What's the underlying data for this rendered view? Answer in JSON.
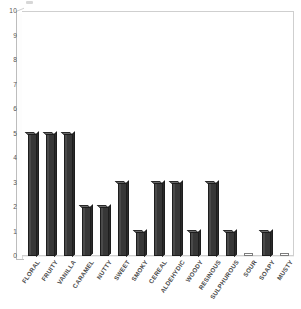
{
  "chart_data": {
    "type": "bar",
    "title": "",
    "subtitle": "",
    "xlabel": "",
    "ylabel": "",
    "ylim": [
      0,
      10
    ],
    "yticks": [
      0,
      1,
      2,
      3,
      4,
      5,
      6,
      7,
      8,
      9,
      10
    ],
    "grid": false,
    "legend": null,
    "orientation": "vertical",
    "bar_color": "#3b3b3b",
    "plot_border_color": "#cfcfcf",
    "categories": [
      "FLORAL",
      "FRUITY",
      "VANILLA",
      "CARAMEL",
      "NUTTY",
      "SWEET",
      "SMOKY",
      "CEREAL",
      "ALDEHYDIC",
      "WOODY",
      "RESINOUS",
      "SULPHUROUS",
      "SOUR",
      "SOAPY",
      "MUSTY"
    ],
    "values": [
      5,
      5,
      5,
      2,
      2,
      3,
      1,
      3,
      3,
      1,
      3,
      1,
      0,
      1,
      0
    ]
  },
  "axes": {
    "y_tick_labels": [
      "10",
      "9",
      "8",
      "7",
      "6",
      "5",
      "4",
      "3",
      "2",
      "1",
      "0"
    ]
  }
}
